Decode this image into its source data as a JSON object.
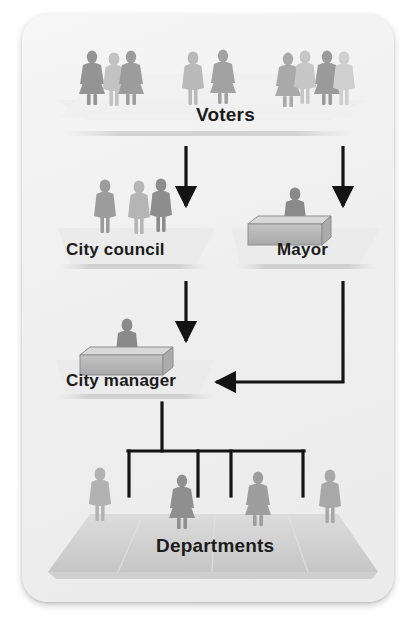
{
  "diagram": {
    "type": "organizational-flow-chart",
    "background_color": "#f1f1f1",
    "card_color": "#f2f2f2",
    "line_color": "#1a1a1a",
    "figure_color": "#9a9a9a",
    "platform_color": "#c9c9c9",
    "nodes": [
      {
        "id": "voters",
        "label": "Voters",
        "level": 1,
        "icon": "group-of-people-icon",
        "people_count": 9
      },
      {
        "id": "council",
        "label": "City council",
        "level": 2,
        "icon": "group-of-people-icon",
        "people_count": 3
      },
      {
        "id": "mayor",
        "label": "Mayor",
        "level": 2,
        "icon": "person-at-desk-icon",
        "people_count": 1
      },
      {
        "id": "manager",
        "label": "City manager",
        "level": 3,
        "icon": "person-at-desk-icon",
        "people_count": 1
      },
      {
        "id": "departments",
        "label": "Departments",
        "level": 4,
        "icon": "group-of-people-icon",
        "people_count": 4
      }
    ],
    "edges": [
      {
        "from": "voters",
        "to": "council",
        "style": "straight-arrow-down"
      },
      {
        "from": "voters",
        "to": "mayor",
        "style": "straight-arrow-down"
      },
      {
        "from": "council",
        "to": "manager",
        "style": "straight-arrow-down"
      },
      {
        "from": "mayor",
        "to": "manager",
        "style": "elbow-arrow-left"
      },
      {
        "from": "manager",
        "to": "departments",
        "style": "tree-bracket",
        "branches": 4
      }
    ]
  }
}
